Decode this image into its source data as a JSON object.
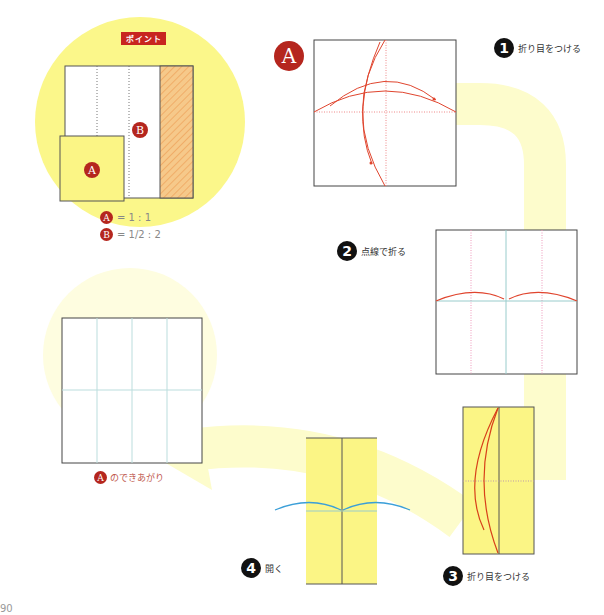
{
  "point_box": {
    "banner": "ポイント",
    "label_a": "A",
    "label_b": "B",
    "ratios": [
      {
        "badge": "A",
        "text": "= 1 : 1"
      },
      {
        "badge": "B",
        "text": "= 1/2 : 2"
      }
    ]
  },
  "title_badge": "A",
  "steps": [
    {
      "number": "1",
      "text": "折り目をつける"
    },
    {
      "number": "2",
      "text": "点線で折る"
    },
    {
      "number": "3",
      "text": "折り目をつける"
    },
    {
      "number": "4",
      "text": "開く"
    }
  ],
  "result": {
    "badge": "A",
    "text": "のできあがり"
  },
  "page_number": "90",
  "colors": {
    "yellow_bg": "#fafaa0",
    "paper_yellow": "#fbf585",
    "red_accent": "#c8251f",
    "fold_arrow_red": "#e0452e",
    "open_arrow_blue": "#3b9fd8",
    "crease_teal": "#9fd4c9"
  }
}
